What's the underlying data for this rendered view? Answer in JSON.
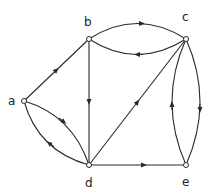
{
  "diagram": {
    "type": "directed-graph",
    "nodes": [
      {
        "id": "a",
        "label": "a",
        "x": 24,
        "y": 101
      },
      {
        "id": "b",
        "label": "b",
        "x": 89,
        "y": 39
      },
      {
        "id": "c",
        "label": "c",
        "x": 186,
        "y": 39
      },
      {
        "id": "d",
        "label": "d",
        "x": 89,
        "y": 165
      },
      {
        "id": "e",
        "label": "e",
        "x": 186,
        "y": 165
      }
    ],
    "edges": [
      {
        "from": "a",
        "to": "b",
        "shape": "straight"
      },
      {
        "from": "b",
        "to": "c",
        "shape": "curve-upper"
      },
      {
        "from": "c",
        "to": "b",
        "shape": "curve-lower"
      },
      {
        "from": "b",
        "to": "d",
        "shape": "straight"
      },
      {
        "from": "a",
        "to": "d",
        "shape": "curve-upper"
      },
      {
        "from": "d",
        "to": "a",
        "shape": "curve-lower"
      },
      {
        "from": "d",
        "to": "c",
        "shape": "straight"
      },
      {
        "from": "d",
        "to": "e",
        "shape": "straight"
      },
      {
        "from": "c",
        "to": "e",
        "shape": "curve-right"
      },
      {
        "from": "e",
        "to": "c",
        "shape": "curve-left"
      }
    ],
    "colors": {
      "stroke": "#2a2a2a",
      "background": "#ffffff"
    }
  }
}
